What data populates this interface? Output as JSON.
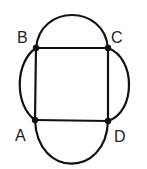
{
  "diagram": {
    "type": "graph",
    "colors": {
      "stroke": "#111111",
      "label": "#222222",
      "background": "#ffffff"
    },
    "vertices": [
      {
        "id": "A",
        "label": "A",
        "x": 35,
        "y": 120,
        "label_x": 15,
        "label_y": 140
      },
      {
        "id": "B",
        "label": "B",
        "x": 36,
        "y": 48,
        "label_x": 16,
        "label_y": 42
      },
      {
        "id": "C",
        "label": "C",
        "x": 108,
        "y": 48,
        "label_x": 112,
        "label_y": 42
      },
      {
        "id": "D",
        "label": "D",
        "x": 108,
        "y": 121,
        "label_x": 114,
        "label_y": 141
      }
    ],
    "edges": [
      {
        "from": "A",
        "to": "B",
        "kind": "straight"
      },
      {
        "from": "B",
        "to": "C",
        "kind": "straight"
      },
      {
        "from": "C",
        "to": "D",
        "kind": "straight"
      },
      {
        "from": "D",
        "to": "A",
        "kind": "straight"
      },
      {
        "from": "B",
        "to": "C",
        "kind": "arc-top"
      },
      {
        "from": "C",
        "to": "D",
        "kind": "arc-right"
      },
      {
        "from": "D",
        "to": "A",
        "kind": "arc-bottom"
      },
      {
        "from": "A",
        "to": "B",
        "kind": "arc-left"
      }
    ]
  }
}
